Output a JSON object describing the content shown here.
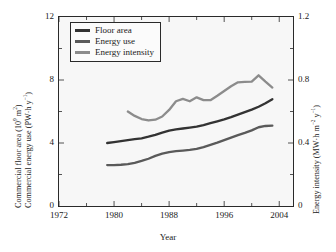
{
  "chart_data": {
    "type": "line",
    "title": "",
    "xlabel": "Year",
    "ylabel_left": "Commercial floor area (10⁹ m²) / Commercial energy use (PW·h y⁻¹)",
    "ylabel_right": "Energy intensity (MW·h m⁻² y⁻¹)",
    "xlim": [
      1972,
      2006
    ],
    "ylim_left": [
      0,
      12
    ],
    "ylim_right": [
      0,
      1.2
    ],
    "xticks": [
      1972,
      1980,
      1988,
      1996,
      2004
    ],
    "xticks_minor": [
      1976,
      1984,
      1992,
      2000
    ],
    "yticks_left": [
      0,
      4,
      8,
      12
    ],
    "yticks_left_minor": [
      2,
      6,
      10
    ],
    "yticks_right": [
      "0",
      "0.4",
      "0.8",
      "1.2"
    ],
    "grid": false,
    "legend_position": "upper-left",
    "series": [
      {
        "name": "Floor area",
        "axis": "left",
        "color": "#333333",
        "x": [
          1979,
          1980,
          1981,
          1982,
          1983,
          1984,
          1985,
          1986,
          1987,
          1988,
          1989,
          1990,
          1991,
          1992,
          1993,
          1994,
          1995,
          1996,
          1997,
          1998,
          1999,
          2000,
          2001,
          2002,
          2003
        ],
        "values": [
          4.0,
          4.06,
          4.12,
          4.18,
          4.24,
          4.3,
          4.4,
          4.52,
          4.66,
          4.78,
          4.86,
          4.92,
          4.98,
          5.04,
          5.14,
          5.26,
          5.38,
          5.5,
          5.64,
          5.8,
          5.96,
          6.12,
          6.3,
          6.52,
          6.78
        ]
      },
      {
        "name": "Energy use",
        "axis": "left",
        "color": "#5a5a5a",
        "x": [
          1979,
          1980,
          1981,
          1982,
          1983,
          1984,
          1985,
          1986,
          1987,
          1988,
          1989,
          1990,
          1991,
          1992,
          1993,
          1994,
          1995,
          1996,
          1997,
          1998,
          1999,
          2000,
          2001,
          2002,
          2003
        ],
        "values": [
          2.6,
          2.6,
          2.62,
          2.66,
          2.74,
          2.86,
          3.0,
          3.18,
          3.32,
          3.42,
          3.48,
          3.52,
          3.56,
          3.62,
          3.74,
          3.88,
          4.02,
          4.18,
          4.34,
          4.5,
          4.64,
          4.8,
          5.0,
          5.08,
          5.1
        ]
      },
      {
        "name": "Energy intensity",
        "axis": "right",
        "color": "#8c8c8c",
        "x": [
          1982,
          1983,
          1984,
          1985,
          1986,
          1987,
          1988,
          1989,
          1990,
          1991,
          1992,
          1993,
          1994,
          1995,
          1996,
          1997,
          1998,
          1999,
          2000,
          2001,
          2002,
          2003
        ],
        "values": [
          0.6,
          0.572,
          0.552,
          0.543,
          0.548,
          0.568,
          0.61,
          0.665,
          0.68,
          0.665,
          0.69,
          0.672,
          0.672,
          0.7,
          0.73,
          0.76,
          0.785,
          0.788,
          0.79,
          0.83,
          0.79,
          0.752
        ]
      }
    ]
  },
  "legend": {
    "items": [
      {
        "label": "Floor area"
      },
      {
        "label": "Energy use"
      },
      {
        "label": "Energy intensity"
      }
    ]
  },
  "axes": {
    "x_title": "Year",
    "y_left_line1_pre": "Commercial floor area (10",
    "y_left_line1_sup": "9",
    "y_left_line1_post": " m",
    "y_left_line1_sup2": "2",
    "y_left_line1_end": ")",
    "y_left_line2_pre": "Commercial energy use (PW·h y",
    "y_left_line2_sup": "−1",
    "y_left_line2_end": ")",
    "y_right_line1": "Energy intensity (MW·h m",
    "y_right_sup1": "−2",
    "y_right_mid": " y",
    "y_right_sup2": "−1",
    "y_right_end": ")"
  }
}
